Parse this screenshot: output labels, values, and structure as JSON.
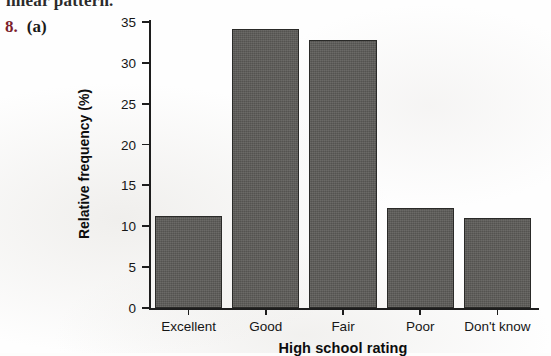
{
  "page": {
    "cut_off_line": "linear pattern.",
    "exercise_number": "8.",
    "exercise_part": "(a)"
  },
  "colors": {
    "bar_fill": "#5c5b58",
    "bar_stroke": "#2a2a28",
    "axis": "#1d1d1d",
    "exercise_number": "#7c1f2e",
    "text": "#161616",
    "page_background": "#fefefe"
  },
  "chart_data": {
    "type": "bar",
    "title": "",
    "xlabel": "High school rating",
    "ylabel": "Relative frequency (%)",
    "categories": [
      "Excellent",
      "Good",
      "Fair",
      "Poor",
      "Don't know"
    ],
    "values": [
      11.2,
      34.2,
      32.8,
      12.3,
      11.0
    ],
    "ylim": [
      0,
      35
    ],
    "yticks": [
      0,
      5,
      10,
      15,
      20,
      25,
      30,
      35
    ],
    "ytick_labels": [
      "0",
      "5",
      "10",
      "15",
      "20",
      "25",
      "30",
      "35"
    ],
    "grid": false,
    "legend": false
  }
}
